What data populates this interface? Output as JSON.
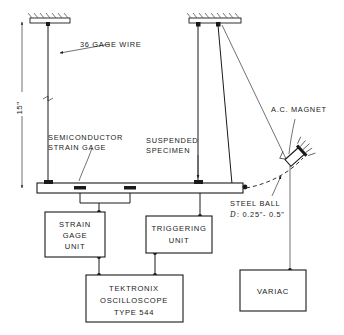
{
  "figure": {
    "background_color": "#ffffff",
    "line_color": "#1a1a1a"
  },
  "labels": {
    "gage_wire": "36  GAGE  WIRE",
    "dimension_height": "15\"",
    "semiconductor_line1": "SEMICONDUCTOR",
    "semiconductor_line2": "STRAIN  GAGE",
    "suspended_line1": "SUSPENDED",
    "suspended_line2": "SPECIMEN",
    "ac_magnet": "A.C. MAGNET",
    "steel_ball": "STEEL  BALL",
    "steel_ball_dia_sym": "D",
    "steel_ball_dia_val": ": 0.25\"- 0.5\""
  },
  "boxes": [
    {
      "id": "strain-gage-unit",
      "lines": [
        "STRAIN",
        "GAGE",
        "UNIT"
      ],
      "x": 45,
      "y": 212,
      "w": 60,
      "h": 45
    },
    {
      "id": "triggering-unit",
      "lines": [
        "TRIGGERING",
        "UNIT"
      ],
      "x": 146,
      "y": 216,
      "w": 66,
      "h": 37
    },
    {
      "id": "oscilloscope",
      "lines": [
        "TEKTRONIX",
        "OSCILLOSCOPE",
        "TYPE  544"
      ],
      "x": 86,
      "y": 275,
      "w": 97,
      "h": 47
    },
    {
      "id": "variac",
      "lines": [
        "VARIAC"
      ],
      "x": 240,
      "y": 270,
      "w": 66,
      "h": 41
    }
  ],
  "components": {
    "beam": {
      "x": 37,
      "y": 183,
      "w": 206,
      "h": 10,
      "name": "suspended-specimen-beam"
    },
    "ceiling_left": {
      "x": 30,
      "y": 18,
      "w": 40,
      "h": 5
    },
    "ceiling_right": {
      "x": 189,
      "y": 18,
      "w": 52,
      "h": 5
    },
    "magnet": {
      "x": 285,
      "y": 148,
      "angle": -40
    }
  }
}
